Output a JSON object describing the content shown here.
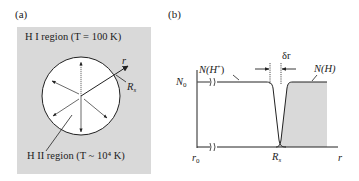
{
  "panel_a": {
    "label": "(a)",
    "outer_region_label": "H I region (T = 100 K)",
    "inner_region_label": "H II region (T ~ 10⁴ K)",
    "radius_label": "R",
    "radius_sub": "s",
    "axis_label": "r",
    "colors": {
      "background": "#d9d9d9",
      "circle_fill": "#ffffff",
      "stroke": "#222222"
    }
  },
  "panel_b": {
    "label": "(b)",
    "y_label": "N",
    "y_label_sub": "0",
    "x_origin_label": "r",
    "x_origin_sub": "0",
    "x_axis_label": "r",
    "rs_label": "R",
    "rs_sub": "s",
    "delta_label": "δr",
    "curve_ion_label": "N(H",
    "curve_ion_sup": "+",
    "curve_ion_close": ")",
    "curve_neutral_label": "N(H)",
    "colors": {
      "shade": "#d9d9d9",
      "stroke": "#222222"
    }
  }
}
